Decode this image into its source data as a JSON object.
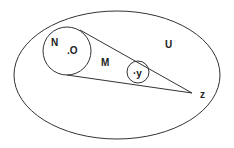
{
  "diagram": {
    "type": "set-region figure",
    "colors": {
      "stroke": "#333333",
      "text": "#222222",
      "background": "#ffffff"
    },
    "regions": {
      "outer_ellipse": {
        "label": "U",
        "cx": 117,
        "cy": 75,
        "rx": 103,
        "ry": 64
      },
      "large_circle": {
        "label": "N",
        "cx": 67,
        "cy": 51,
        "r": 24
      },
      "small_circle": {
        "cx": 138,
        "cy": 72,
        "r": 11
      },
      "cone_region": {
        "label": "M"
      }
    },
    "points": {
      "o": {
        "label": ".O",
        "x": 72,
        "y": 52
      },
      "y": {
        "label": "·y",
        "x": 137,
        "y": 75
      },
      "z": {
        "label": "z",
        "apex_x": 192,
        "apex_y": 93,
        "x": 200,
        "y": 98
      }
    },
    "labels": {
      "U": "U",
      "N": "N",
      "M": "M",
      "O": ".O",
      "y": "·y",
      "z": "z"
    }
  }
}
